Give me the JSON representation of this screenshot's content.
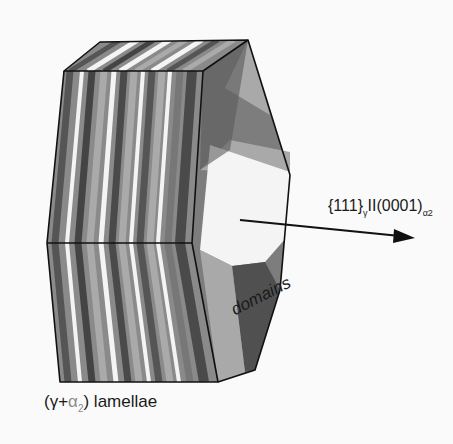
{
  "figure": {
    "type": "schematic 3D block diagram",
    "labels": {
      "orientation_prefix": "{111}",
      "orientation_sub1": "γ",
      "orientation_mid": "II(0001)",
      "orientation_sub2": "α2",
      "lamellae_open": "(γ+",
      "lamellae_alpha": "α",
      "lamellae_sub": "2",
      "lamellae_close": ") lamellae",
      "domains": "domains"
    },
    "colors": {
      "background": "#fafafa",
      "outline": "#111111",
      "light_gray": "#a8a8a8",
      "mid_gray": "#7a7a7a",
      "dark_gray": "#505050",
      "white": "#f4f4f4"
    }
  }
}
